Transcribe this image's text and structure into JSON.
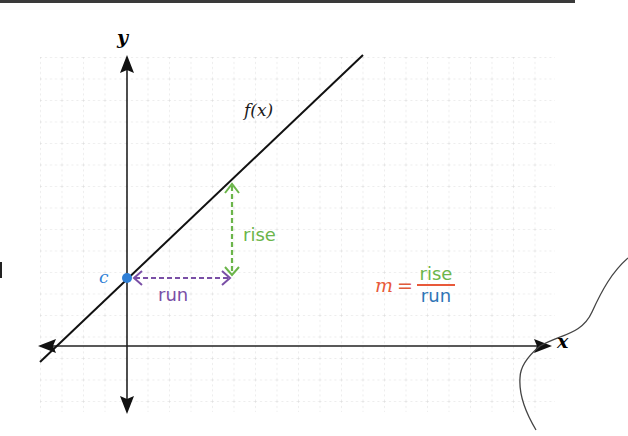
{
  "diagram": {
    "axes": {
      "x_label": "x",
      "y_label": "y",
      "origin_px": [
        127,
        346
      ],
      "x_axis": {
        "from_px": 40,
        "to_px": 552,
        "y_px": 346
      },
      "y_axis": {
        "from_px": 57,
        "to_px": 413,
        "x_px": 127
      }
    },
    "grid": {
      "left": 40,
      "top": 57,
      "right": 555,
      "bottom": 412,
      "spacing": 21.5,
      "style": "dotted",
      "color": "#d4d4d4"
    },
    "function_line": {
      "label": "f(x)",
      "start_px": [
        40,
        362
      ],
      "end_px": [
        363,
        55
      ],
      "color": "#111111"
    },
    "intercept": {
      "label": "c",
      "point_px": [
        127,
        278
      ],
      "color": "#2f7fd6"
    },
    "run": {
      "label": "run",
      "from_px": [
        133,
        278
      ],
      "to_px": [
        229,
        278
      ],
      "color": "#7a4fa6"
    },
    "rise": {
      "label": "rise",
      "from_px": [
        232,
        275
      ],
      "to_px": [
        232,
        183
      ],
      "color": "#6bb54a"
    },
    "formula": {
      "lhs": "m",
      "equals": "=",
      "numerator": "rise",
      "denominator": "run",
      "colors": {
        "lhs": "#e8593a",
        "numerator": "#6bb54a",
        "denominator": "#2e75b6",
        "bar": "#e8593a"
      }
    },
    "annotation_curve": {
      "color": "#444444",
      "description": "hand-drawn curve at right edge"
    }
  }
}
